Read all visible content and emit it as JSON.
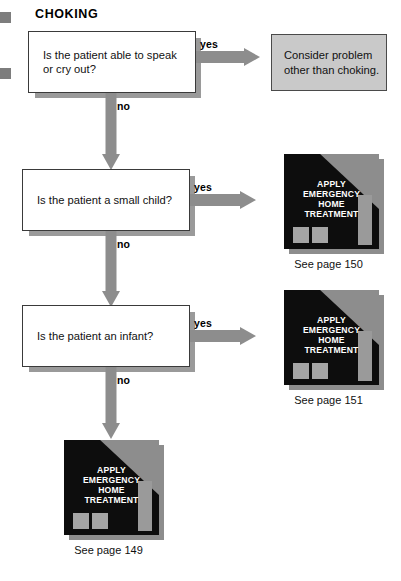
{
  "page": {
    "title": "CHOKING",
    "width": 401,
    "height": 581,
    "colors": {
      "arrow": "#8d8d8d",
      "outcome_box_fill": "#c9c9c9",
      "icon_background": "#0d0d0d",
      "icon_accent": "#8d8d8d",
      "icon_text": "#ffffff",
      "box_border": "#3a3a3a",
      "box_shadow": "#9a9a9a"
    }
  },
  "edge_marks": [
    {
      "name": "edge-mark-top"
    },
    {
      "name": "edge-mark-bottom"
    }
  ],
  "decisions": [
    {
      "id": "speak",
      "question": "Is the patient able to speak\nor cry out?",
      "line1": "Is the patient able to speak",
      "line2": "or cry out?",
      "yes_label": "yes",
      "no_label": "no"
    },
    {
      "id": "small-child",
      "question": "Is the patient a small child?",
      "line1": "Is the patient a small child?",
      "line2": "",
      "yes_label": "yes",
      "no_label": "no"
    },
    {
      "id": "infant",
      "question": "Is the patient an infant?",
      "line1": "Is the patient an infant?",
      "line2": "",
      "yes_label": "yes",
      "no_label": "no"
    }
  ],
  "outcome_box": {
    "line1": "Consider problem",
    "line2": "other than choking."
  },
  "treatment_icons": [
    {
      "id": "treatment-150",
      "line1": "APPLY",
      "line2": "EMERGENCY",
      "line3": "HOME",
      "line4": "TREATMENT",
      "caption": "See page 150"
    },
    {
      "id": "treatment-151",
      "line1": "APPLY",
      "line2": "EMERGENCY",
      "line3": "HOME",
      "line4": "TREATMENT",
      "caption": "See page 151"
    },
    {
      "id": "treatment-149",
      "line1": "APPLY",
      "line2": "EMERGENCY",
      "line3": "HOME",
      "line4": "TREATMENT",
      "caption": "See page 149"
    }
  ]
}
